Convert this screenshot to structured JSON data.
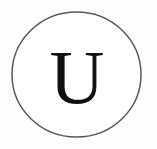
{
  "canvas": {
    "width": 157,
    "height": 149,
    "background_color": "#fdfdfd"
  },
  "badge": {
    "label": "circular-letter-badge",
    "shape": "circle",
    "center_x": 76.5,
    "center_y": 74.5,
    "radius_x": 64.5,
    "radius_y": 62.5,
    "stroke_color": "#595959",
    "stroke_width": 1.5,
    "fill_color": "#ffffff"
  },
  "letter": {
    "text": "U",
    "color": "#111111",
    "font_size_px": 76,
    "center_x": 77,
    "baseline_y": 103,
    "typeface_style": "serif"
  }
}
